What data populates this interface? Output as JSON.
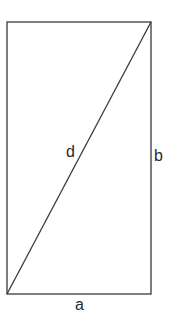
{
  "diagram": {
    "type": "rectangle-with-diagonal",
    "labels": {
      "diagonal": "d",
      "height": "b",
      "width": "a"
    },
    "colors": {
      "stroke": "#3a3a3a",
      "text": "#2a2a2a",
      "background": "#ffffff"
    }
  }
}
